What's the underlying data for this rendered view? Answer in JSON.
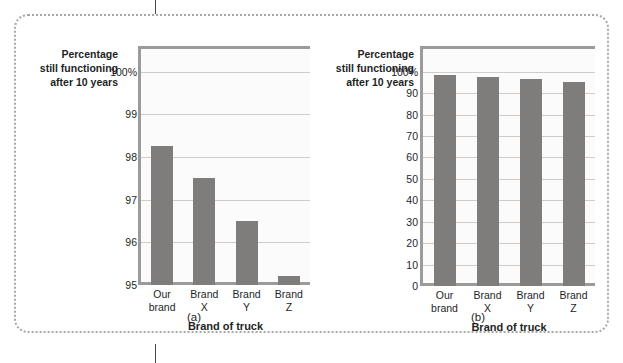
{
  "figure": {
    "tick_top": "",
    "tick_bottom": ""
  },
  "chart_data": [
    {
      "type": "bar",
      "panel_label": "(a)",
      "title": "",
      "ylabel": "Percentage still functioning after 10 years",
      "ylabel_lines": [
        "Percentage",
        "still functioning",
        "after 10 years"
      ],
      "xlabel": "Brand of truck",
      "categories": [
        "Our brand",
        "Brand X",
        "Brand Y",
        "Brand Z"
      ],
      "category_lines": [
        [
          "Our",
          "brand"
        ],
        [
          "Brand",
          "X"
        ],
        [
          "Brand",
          "Y"
        ],
        [
          "Brand",
          "Z"
        ]
      ],
      "values": [
        98.25,
        97.5,
        96.5,
        95.2
      ],
      "ylim": [
        95,
        100.6
      ],
      "yticks": [
        95,
        96,
        97,
        98,
        99,
        100
      ],
      "ytick_labels": [
        "95",
        "96",
        "97",
        "98",
        "99",
        "100%"
      ],
      "grid": true,
      "legend": "none",
      "bar_color": "#7f7c7c",
      "plot_bg": "#fbfbfb",
      "axis_color": "#9d9a9a",
      "grid_color": "#cfcccc"
    },
    {
      "type": "bar",
      "panel_label": "(b)",
      "title": "",
      "ylabel": "Percentage still functioning after 10 years",
      "ylabel_lines": [
        "Percentage",
        "still functioning",
        "after 10 years"
      ],
      "xlabel": "Brand of truck",
      "categories": [
        "Our brand",
        "Brand X",
        "Brand Y",
        "Brand Z"
      ],
      "category_lines": [
        [
          "Our",
          "brand"
        ],
        [
          "Brand",
          "X"
        ],
        [
          "Brand",
          "Y"
        ],
        [
          "Brand",
          "Z"
        ]
      ],
      "values": [
        98.25,
        97.5,
        96.5,
        95.2
      ],
      "ylim": [
        0,
        112
      ],
      "yticks": [
        0,
        10,
        20,
        30,
        40,
        50,
        60,
        70,
        80,
        90,
        100
      ],
      "ytick_labels": [
        "0",
        "10",
        "20",
        "30",
        "40",
        "50",
        "60",
        "70",
        "80",
        "90",
        "100%"
      ],
      "grid": true,
      "legend": "none",
      "bar_color": "#7f7c7c",
      "plot_bg": "#fbfbfb",
      "axis_color": "#9d9a9a",
      "grid_color": "#cfcccc"
    }
  ]
}
